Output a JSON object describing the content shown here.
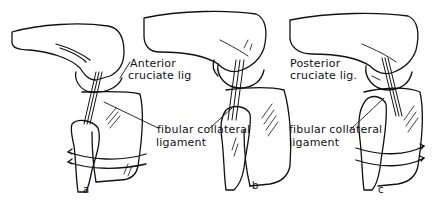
{
  "figure": {
    "panels": [
      {
        "id": "a",
        "letter": "a",
        "label_line1": "Anterior",
        "label_line2": "cruciate lig",
        "collateral_line1": "fibular collateral",
        "collateral_line2": "ligament"
      },
      {
        "id": "b",
        "letter": "b",
        "collateral_line1": "fibular collateral",
        "collateral_line2": "ligament"
      },
      {
        "id": "c",
        "letter": "c",
        "label_line1": "Posterior",
        "label_line2": "cruciate lig."
      }
    ],
    "colors": {
      "ink": "#111111",
      "paper": "#ffffff"
    }
  }
}
